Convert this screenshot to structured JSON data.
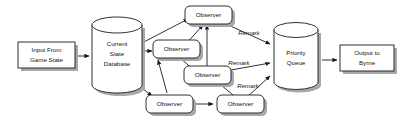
{
  "diagram": {
    "background_color": "#ffffff",
    "stroke_color": "#1a1a1a",
    "shadow_color": "#a8a8a8",
    "shape_fill_color": "#ffffff",
    "nodes": {
      "input": {
        "shape": "rectangle",
        "line1": "Input From",
        "line2": "Game State"
      },
      "database": {
        "shape": "cylinder",
        "line1": "Current",
        "line2": "State",
        "line3": "Database"
      },
      "observer_center": {
        "shape": "rounded-rectangle",
        "label": "Observer"
      },
      "observer_top": {
        "shape": "rounded-rectangle",
        "label": "Observer"
      },
      "observer_right": {
        "shape": "rounded-rectangle",
        "label": "Observer"
      },
      "observer_bottom_left": {
        "shape": "rounded-rectangle",
        "label": "Observer"
      },
      "observer_bottom_right": {
        "shape": "rounded-rectangle",
        "label": "Observer"
      },
      "queue": {
        "shape": "cylinder",
        "line1": "Priority",
        "line2": "Queue"
      },
      "output": {
        "shape": "rectangle",
        "line1": "Output to",
        "line2": "Byrne"
      }
    },
    "edge_labels": {
      "remark_top": "Remark",
      "remark_middle": "Remark",
      "remark_bottom": "Remark"
    }
  }
}
